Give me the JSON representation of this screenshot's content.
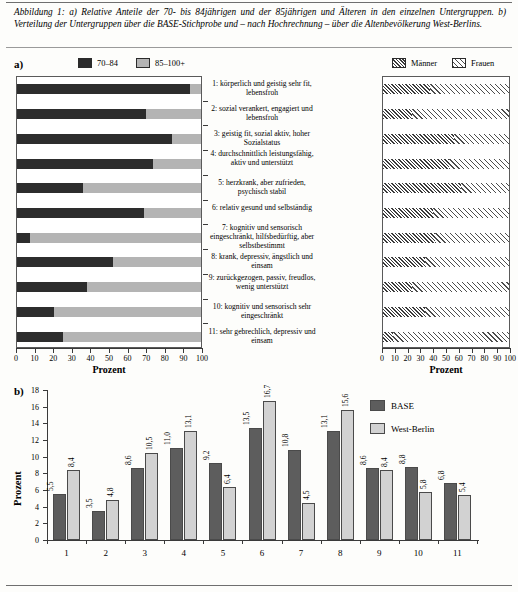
{
  "caption": {
    "label": "Abbildung 1:",
    "text": "a) Relative Anteile der 70- bis 84jährigen und der 85jährigen und Älteren in den einzelnen Untergruppen. b) Verteilung der Untergruppen über die BASE-Stichprobe und – nach Hochrechnung – über die Altenbevölkerung West-Berlins."
  },
  "panel_a": {
    "letter": "a)"
  },
  "panel_b": {
    "letter": "b)"
  },
  "legend_age": [
    {
      "label": "70–84",
      "key": "dark"
    },
    {
      "label": "85–100+",
      "key": "light"
    }
  ],
  "legend_sex": [
    {
      "label": "Männer",
      "key": "men"
    },
    {
      "label": "Frauen",
      "key": "women"
    }
  ],
  "legend_b": [
    {
      "label": "BASE",
      "key": "base"
    },
    {
      "label": "West-Berlin",
      "key": "west"
    }
  ],
  "groups": [
    "1: körperlich und geistig sehr fit, lebensfroh",
    "2: sozial verankert, engagiert und lebensfroh",
    "3: geistig fit, sozial aktiv, hoher Sozialstatus",
    "4: durchschnittlich leistungsfähig, aktiv und unterstützt",
    "5: herzkrank, aber zufrieden, psychisch stabil",
    "6: relativ gesund und selbständig",
    "7: kognitiv und sensorisch eingeschränkt, hilfsbedürftig, aber selbstbestimmt",
    "8: krank, depressiv, ängstlich und einsam",
    "9: zurückgezogen, passiv, freudlos, wenig unterstützt",
    "10: kognitiv und sensorisch sehr eingeschränkt",
    "11: sehr gebrechlich, depressiv und einsam"
  ],
  "axis": {
    "x_title": "Prozent",
    "x_ticks": [
      0,
      10,
      20,
      30,
      40,
      50,
      60,
      70,
      80,
      90,
      100
    ]
  },
  "chart_data": [
    {
      "type": "bar",
      "orientation": "horizontal",
      "stacked": true,
      "title": "a) links: Altersverteilung je Untergruppe",
      "xlabel": "Prozent",
      "ylabel": "",
      "xlim": [
        0,
        100
      ],
      "categories": [
        "1",
        "2",
        "3",
        "4",
        "5",
        "6",
        "7",
        "8",
        "9",
        "10",
        "11"
      ],
      "series": [
        {
          "name": "70–84",
          "values": [
            94,
            70,
            84,
            74,
            36,
            69,
            7,
            52,
            38,
            20,
            25
          ]
        },
        {
          "name": "85–100+",
          "values": [
            6,
            30,
            16,
            26,
            64,
            31,
            93,
            48,
            62,
            80,
            75
          ]
        }
      ],
      "legend_position": "top"
    },
    {
      "type": "bar",
      "orientation": "horizontal",
      "stacked": true,
      "title": "a) rechts: Geschlechterverteilung je Untergruppe",
      "xlabel": "Prozent",
      "ylabel": "",
      "xlim": [
        0,
        100
      ],
      "categories": [
        "1",
        "2",
        "3",
        "4",
        "5",
        "6",
        "7",
        "8",
        "9",
        "10",
        "11"
      ],
      "series": [
        {
          "name": "Männer",
          "values": [
            37,
            23,
            56,
            52,
            62,
            40,
            41,
            33,
            23,
            33,
            8
          ]
        },
        {
          "name": "Frauen",
          "values": [
            63,
            77,
            44,
            48,
            38,
            60,
            59,
            67,
            77,
            67,
            92
          ]
        }
      ],
      "legend_position": "top"
    },
    {
      "type": "bar",
      "orientation": "vertical",
      "title": "b) Verteilung der Untergruppen",
      "xlabel": "",
      "ylabel": "Prozent",
      "ylim": [
        0,
        18
      ],
      "y_ticks": [
        0,
        2,
        4,
        6,
        8,
        10,
        12,
        14,
        16,
        18
      ],
      "categories": [
        "1",
        "2",
        "3",
        "4",
        "5",
        "6",
        "7",
        "8",
        "9",
        "10",
        "11"
      ],
      "series": [
        {
          "name": "BASE",
          "values": [
            5.5,
            3.5,
            8.6,
            11.0,
            9.2,
            13.5,
            10.8,
            13.1,
            8.6,
            8.8,
            6.8
          ],
          "labels": [
            "5,5",
            "3,5",
            "8,6",
            "11,0",
            "9,2",
            "13,5",
            "10,8",
            "13,1",
            "8,6",
            "8,8",
            "6,8"
          ]
        },
        {
          "name": "West-Berlin",
          "values": [
            8.4,
            4.8,
            10.5,
            13.1,
            6.4,
            16.7,
            4.5,
            15.6,
            8.4,
            5.8,
            5.4
          ],
          "labels": [
            "8,4",
            "4,8",
            "10,5",
            "13,1",
            "6,4",
            "16,7",
            "4,5",
            "15,6",
            "8,4",
            "5,8",
            "5,4"
          ]
        }
      ],
      "legend_position": "top-right"
    }
  ],
  "colors": {
    "dark": "#2d2d2d",
    "light": "#b4b4b4",
    "base": "#5d5d5d",
    "west": "#d2d2d2"
  }
}
